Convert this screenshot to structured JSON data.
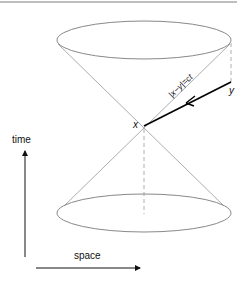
{
  "figure": {
    "labels": {
      "point_x": "x",
      "point_y": "y",
      "cone_edge": "|x−y|=ct",
      "time_axis": "time",
      "space_axis": "space"
    },
    "colors": {
      "cone_lines": "#8a8a8a",
      "ellipse": "#7a7a7a",
      "dashed": "#9a9a9a",
      "worldline": "#000000",
      "axes": "#111111",
      "top_rule": "#7f7f7f"
    },
    "elements": {
      "upper_cone": {
        "center": [
          144,
          40
        ],
        "rx": 87,
        "ry": 19
      },
      "lower_cone": {
        "center": [
          144,
          213
        ],
        "rx": 87,
        "ry": 19
      },
      "apex": [
        144,
        126
      ],
      "point_y": [
        231,
        82
      ]
    }
  }
}
